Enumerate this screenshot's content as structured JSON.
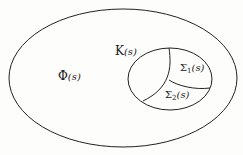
{
  "diagram": {
    "outer_set": {
      "symbol": "Φ",
      "arg": "(s)"
    },
    "inner_set": {
      "symbol": "K",
      "arg": "(s)"
    },
    "region1": {
      "symbol": "Σ",
      "sub": "1",
      "arg": "(s)"
    },
    "region2": {
      "symbol": "Σ",
      "sub": "2",
      "arg": "(s)"
    }
  },
  "colors": {
    "line": "#222222",
    "background": "#fdfdfb"
  }
}
